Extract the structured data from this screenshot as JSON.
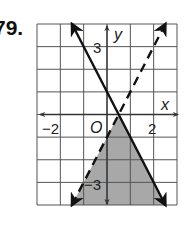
{
  "problem": {
    "number_label": "79."
  },
  "chart_data": {
    "type": "line",
    "title": "",
    "xlabel": "x",
    "ylabel": "y",
    "xlim": [
      -3,
      3
    ],
    "ylim": [
      -4,
      4
    ],
    "grid": true,
    "origin_label": "O",
    "tick_labels": {
      "x": [
        {
          "value": -2,
          "label": "−2"
        },
        {
          "value": 2,
          "label": "2"
        }
      ],
      "y": [
        {
          "value": 3,
          "label": "3"
        },
        {
          "value": -3,
          "label": "−3"
        }
      ]
    },
    "series": [
      {
        "name": "boundary-solid",
        "equation": "y = -2x + 1",
        "style": "solid",
        "slope": -2,
        "intercept": 1,
        "points": [
          [
            -1.5,
            4
          ],
          [
            2.5,
            -4
          ]
        ]
      },
      {
        "name": "boundary-dashed",
        "equation": "y = 2x - 1",
        "style": "dashed",
        "slope": 2,
        "intercept": -1,
        "points": [
          [
            -1.5,
            -4
          ],
          [
            2.5,
            4
          ]
        ]
      }
    ],
    "shaded_region": {
      "description": "y <= -2x + 1 and y < 2x - 1",
      "vertices": [
        [
          0.5,
          0
        ],
        [
          2.5,
          -4
        ],
        [
          -1.5,
          -4
        ]
      ],
      "color": "#a8a8a8"
    },
    "colors": {
      "grid": "#555555",
      "lines": "#111111",
      "shade": "#a8a8a8"
    }
  }
}
